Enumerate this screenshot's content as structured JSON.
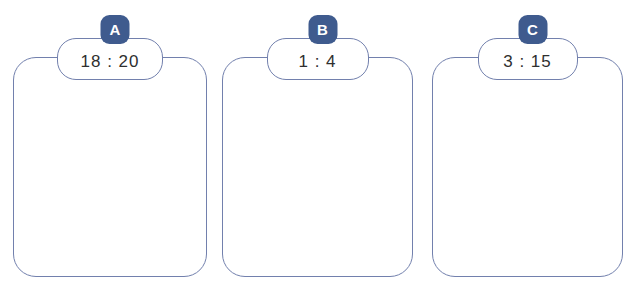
{
  "colors": {
    "card_border": "#7280ad",
    "badge_bg": "#3f5b8e",
    "badge_text": "#ffffff",
    "label_text": "#2f2f2f",
    "page_bg": "#ffffff"
  },
  "cards": [
    {
      "badge": "A",
      "ratio": "18 : 20"
    },
    {
      "badge": "B",
      "ratio": "1 : 4"
    },
    {
      "badge": "C",
      "ratio": "3 : 15"
    }
  ]
}
